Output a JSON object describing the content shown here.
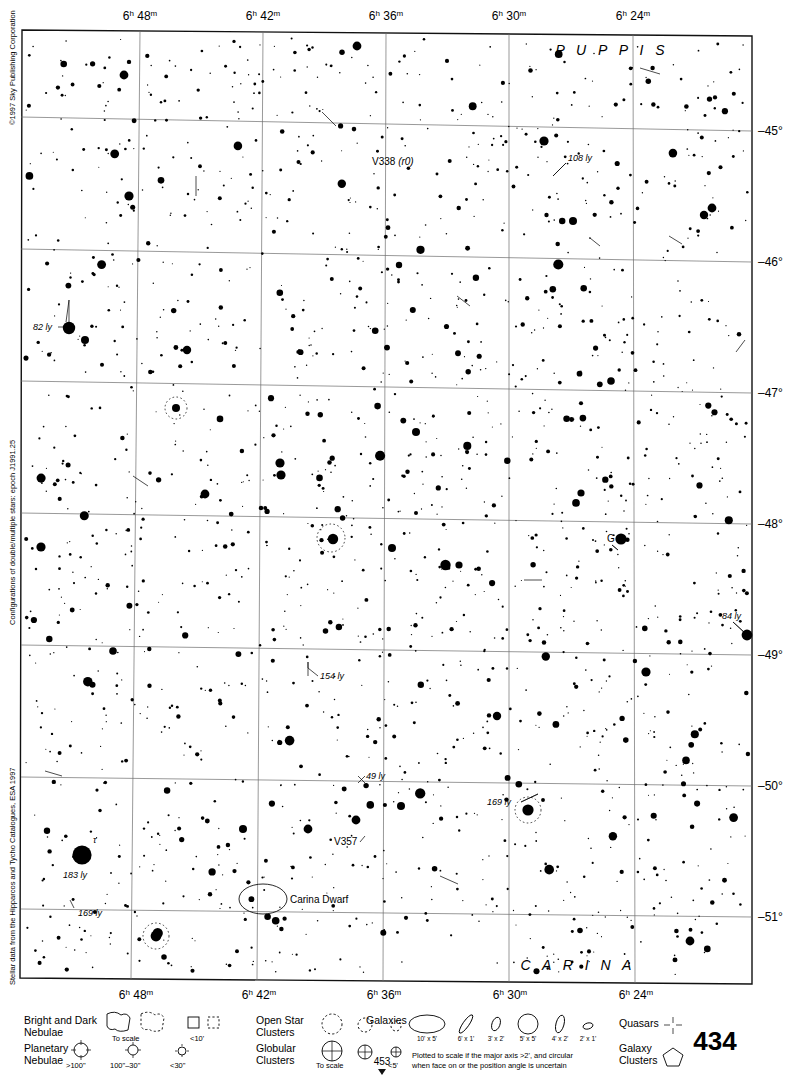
{
  "meta": {
    "page_number": "434",
    "page_marker": "453",
    "copyright": "©1997 Sky Publishing Corporation",
    "side_note_double": "Configurations of double/multiple stars: epoch J1991.25",
    "side_note_stellar": "Stellar data from the Hipparcos and Tycho Catalogues, ESA 1997"
  },
  "chart_data": {
    "type": "scatter",
    "xlabel": "Right Ascension",
    "ylabel": "Declination",
    "x_axis": {
      "unit": "hours/minutes",
      "ticks": [
        "6h 48m",
        "6h 42m",
        "6h 36m",
        "6h 30m",
        "6h 24m"
      ],
      "tick_px": [
        140,
        263,
        386,
        509,
        633
      ],
      "direction": "right-to-left (RA decreasing)"
    },
    "y_axis": {
      "unit": "degrees",
      "ticks": [
        "-45°",
        "-46°",
        "-47°",
        "-48°",
        "-49°",
        "-50°",
        "-51°"
      ],
      "tick_px": [
        131,
        262,
        393,
        524,
        655,
        786,
        917
      ]
    },
    "grid": true,
    "constellations": [
      {
        "name": "P U P P I S",
        "x": 612,
        "y": 50
      },
      {
        "name": "C A R I N A",
        "x": 578,
        "y": 966
      }
    ],
    "annotations": [
      {
        "label": "V338 (r0)",
        "x": 396,
        "y": 162,
        "type": "variable-star"
      },
      {
        "label": "108 ly",
        "x": 580,
        "y": 160,
        "type": "distance"
      },
      {
        "label": "82 ly",
        "x": 45,
        "y": 327,
        "type": "distance"
      },
      {
        "label": "G",
        "x": 613,
        "y": 538,
        "type": "star-designation"
      },
      {
        "label": "84 ly",
        "x": 737,
        "y": 617,
        "type": "distance"
      },
      {
        "label": "154 ly",
        "x": 333,
        "y": 676,
        "type": "distance"
      },
      {
        "label": "49 ly",
        "x": 375,
        "y": 776,
        "type": "distance"
      },
      {
        "label": "169 ly",
        "x": 496,
        "y": 801,
        "type": "distance"
      },
      {
        "label": "V357",
        "x": 347,
        "y": 841,
        "type": "variable-star"
      },
      {
        "label": "183 ly",
        "x": 78,
        "y": 872,
        "type": "distance"
      },
      {
        "label": "169 ly",
        "x": 90,
        "y": 913,
        "type": "distance"
      },
      {
        "label": "Carina Dwarf",
        "x": 288,
        "y": 903,
        "type": "galaxy"
      },
      {
        "label": "τ",
        "x": 96,
        "y": 840,
        "type": "bayer-designation"
      }
    ]
  },
  "legend": {
    "items": [
      {
        "name": "Bright and Dark Nebulae",
        "line1": "Bright and Dark",
        "line2": "Nebulae",
        "sublabels": [
          "To scale",
          "<10'"
        ]
      },
      {
        "name": "Planetary Nebulae",
        "line1": "Planetary",
        "line2": "Nebulae",
        "sublabels": [
          ">100\"",
          "100\"–30\"",
          "<30\""
        ]
      },
      {
        "name": "Open Star Clusters",
        "line1": "Open Star",
        "line2": "Clusters",
        "sublabels": []
      },
      {
        "name": "Globular Clusters",
        "line1": "Globular",
        "line2": "Clusters",
        "sublabels": [
          "To scale",
          "<5'"
        ]
      },
      {
        "name": "Galaxies",
        "line1": "Galaxies",
        "line2": "",
        "sublabels": [
          "10' x 5'",
          "6' x 1'",
          "3' x 2'",
          "5' x 5'",
          "4' x 2'",
          "2' x 1'"
        ]
      },
      {
        "name": "Quasars",
        "line1": "Quasars",
        "line2": "",
        "sublabels": []
      },
      {
        "name": "Galaxy Clusters",
        "line1": "Galaxy",
        "line2": "Clusters",
        "sublabels": []
      }
    ],
    "galaxy_note_line1": "Plotted to scale if the major axis >2', and circular",
    "galaxy_note_line2": "when face on or the position angle is uncertain"
  },
  "colors": {
    "ink": "#111111",
    "grid": "#6d6d6d",
    "background": "#ffffff"
  }
}
